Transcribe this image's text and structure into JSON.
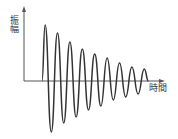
{
  "chart_data": {
    "type": "line",
    "title": "",
    "xlabel": "時間",
    "ylabel": "振幅",
    "grid": false,
    "legend": null,
    "line_color": "#333333",
    "axis_color": "#555555",
    "series": [
      {
        "name": "damped-oscillation",
        "peaks": [
          {
            "t": 1,
            "amplitude": 56
          },
          {
            "t": 2,
            "amplitude": 48
          },
          {
            "t": 3,
            "amplitude": 39
          },
          {
            "t": 4,
            "amplitude": 32
          },
          {
            "t": 5,
            "amplitude": 27
          },
          {
            "t": 6,
            "amplitude": 23
          },
          {
            "t": 7,
            "amplitude": 18
          },
          {
            "t": 8,
            "amplitude": 14
          },
          {
            "t": 9,
            "amplitude": 12
          }
        ],
        "troughs": [
          {
            "t": 1.5,
            "amplitude": -51
          },
          {
            "t": 2.5,
            "amplitude": -42
          },
          {
            "t": 3.5,
            "amplitude": -36
          },
          {
            "t": 4.5,
            "amplitude": -29
          },
          {
            "t": 5.5,
            "amplitude": -25
          },
          {
            "t": 6.5,
            "amplitude": -19
          },
          {
            "t": 7.5,
            "amplitude": -16
          },
          {
            "t": 8.5,
            "amplitude": -13
          }
        ]
      }
    ]
  },
  "labels": {
    "y_axis": "振幅",
    "x_axis": "時間"
  }
}
